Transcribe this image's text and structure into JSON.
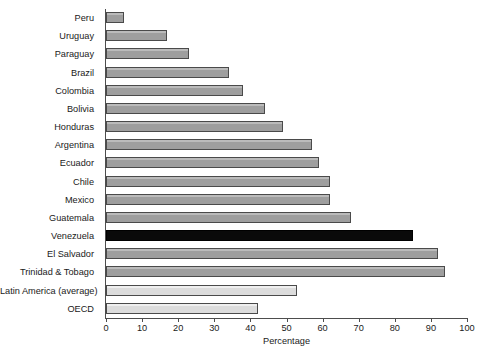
{
  "chart_data": {
    "type": "bar",
    "orientation": "horizontal",
    "title": "",
    "xlabel": "Percentage",
    "ylabel": "",
    "xlim": [
      0,
      100
    ],
    "xticks": [
      0,
      10,
      20,
      30,
      40,
      50,
      60,
      70,
      80,
      90,
      100
    ],
    "grid": false,
    "legend": "none",
    "categories": [
      "Peru",
      "Uruguay",
      "Paraguay",
      "Brazil",
      "Colombia",
      "Bolivia",
      "Honduras",
      "Argentina",
      "Ecuador",
      "Chile",
      "Mexico",
      "Guatemala",
      "Venezuela",
      "El Salvador",
      "Trinidad & Tobago",
      "Latin America (average)",
      "OECD"
    ],
    "values": [
      5,
      17,
      23,
      34,
      38,
      44,
      49,
      57,
      59,
      62,
      62,
      68,
      85,
      92,
      94,
      53,
      42
    ],
    "bar_styles": [
      "standard",
      "standard",
      "standard",
      "standard",
      "standard",
      "standard",
      "standard",
      "standard",
      "standard",
      "standard",
      "standard",
      "standard",
      "highlight",
      "standard",
      "standard",
      "light",
      "light"
    ],
    "colors": {
      "standard_bar": "#9e9e9e",
      "highlight_bar": "#0a0a0a",
      "light_bar": "#dcdcdc",
      "bar_border": "#4a4a4a",
      "axis": "#4d4d4d",
      "text": "#1a1a1a",
      "background": "#ffffff"
    }
  }
}
